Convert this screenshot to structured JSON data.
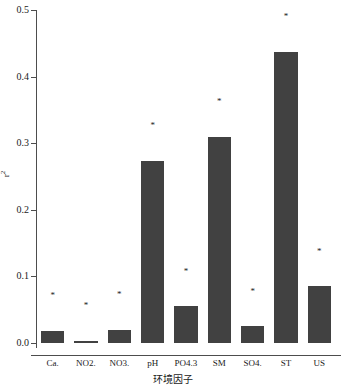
{
  "chart_data": {
    "type": "bar",
    "title": "",
    "xlabel": "环境因子",
    "ylabel": "r²",
    "ylim": [
      0.0,
      0.5
    ],
    "yticks": [
      "0.0",
      "0.1",
      "0.2",
      "0.3",
      "0.4",
      "0.5"
    ],
    "ytick_values": [
      0.0,
      0.1,
      0.2,
      0.3,
      0.4,
      0.5
    ],
    "grid": false,
    "legend": null,
    "bar_color": "#414141",
    "axis_color": "#4d4d4d",
    "categories": [
      "Ca.",
      "NO2.",
      "NO3.",
      "pH",
      "PO4.3",
      "SM",
      "SO4.",
      "ST",
      "US"
    ],
    "values": [
      0.018,
      0.003,
      0.02,
      0.274,
      0.055,
      0.31,
      0.025,
      0.437,
      0.085
    ],
    "annotations": [
      {
        "category": "Ca.",
        "text": "*",
        "y": 0.07
      },
      {
        "category": "NO2.",
        "text": "*",
        "y": 0.056
      },
      {
        "category": "NO3.",
        "text": "*",
        "y": 0.072
      },
      {
        "category": "pH",
        "text": "*",
        "y": 0.326
      },
      {
        "category": "PO4.3",
        "text": "*",
        "y": 0.107
      },
      {
        "category": "SM",
        "text": "*",
        "y": 0.362
      },
      {
        "category": "SO4.",
        "text": "*",
        "y": 0.077
      },
      {
        "category": "ST",
        "text": "*",
        "y": 0.49
      },
      {
        "category": "US",
        "text": "*",
        "y": 0.137
      }
    ]
  }
}
